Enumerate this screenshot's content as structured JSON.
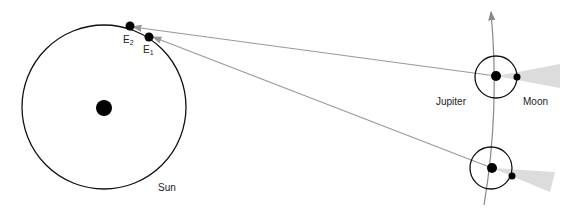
{
  "labels": {
    "sun": "Sun",
    "jupiter": "Jupiter",
    "moon": "Moon",
    "earth2_base": "E",
    "earth2_sub": "2",
    "earth1_base": "E",
    "earth1_sub": "1"
  },
  "colors": {
    "orbit": "#111111",
    "sight_line": "#999999",
    "jupiter_path": "#888888",
    "shadow": "#dcdcdc",
    "body": "#000000"
  }
}
